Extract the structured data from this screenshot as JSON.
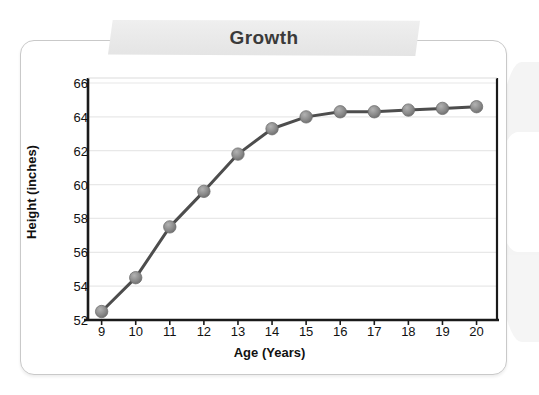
{
  "banner": {
    "title": "Growth"
  },
  "chart_data": {
    "type": "line",
    "title": "Growth",
    "xlabel": "Age (Years)",
    "ylabel": "Height (inches)",
    "x": [
      9,
      10,
      11,
      12,
      13,
      14,
      15,
      16,
      17,
      18,
      19,
      20
    ],
    "values": [
      52.5,
      54.5,
      57.5,
      59.6,
      61.8,
      63.3,
      64.0,
      64.3,
      64.3,
      64.4,
      64.5,
      64.6
    ],
    "xtick_labels": [
      "9",
      "10",
      "11",
      "12",
      "13",
      "14",
      "15",
      "16",
      "17",
      "18",
      "19",
      "20"
    ],
    "ytick_labels": [
      "52",
      "54",
      "56",
      "58",
      "60",
      "62",
      "64",
      "66"
    ],
    "yticks": [
      52,
      54,
      56,
      58,
      60,
      62,
      64,
      66
    ],
    "xlim": [
      8.6,
      20.6
    ],
    "ylim": [
      52,
      66
    ],
    "grid": true,
    "legend": "none",
    "line_color": "#4d4d4d",
    "marker_color": "#8c8c8c",
    "grid_color": "#e8e8e8",
    "axis_color": "#1a1a1a"
  }
}
